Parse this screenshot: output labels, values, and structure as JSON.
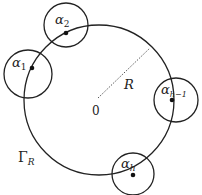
{
  "diagram": {
    "main_circle": {
      "label": "Γ",
      "label_sub": "R",
      "center_label": "0",
      "radius_label": "R"
    },
    "small_circles": [
      {
        "id": "alpha-1",
        "label": "α",
        "sub": "1"
      },
      {
        "id": "alpha-2",
        "label": "α",
        "sub": "2"
      },
      {
        "id": "alpha-h-1",
        "label": "α",
        "sub": "h−1"
      },
      {
        "id": "alpha-h",
        "label": "α",
        "sub": "h"
      }
    ],
    "colors": {
      "stroke": "#222222",
      "background": "#ffffff"
    }
  }
}
